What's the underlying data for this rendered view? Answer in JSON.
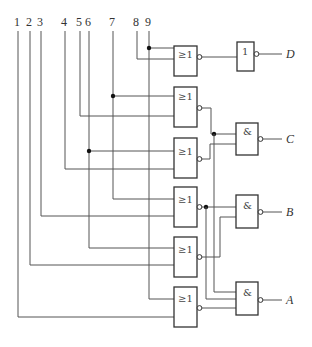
{
  "diagram": {
    "type": "logic-circuit",
    "inputs": [
      "1",
      "2",
      "3",
      "4",
      "5",
      "6",
      "7",
      "8",
      "9"
    ],
    "gates": {
      "nor1": {
        "symbol": "≥1",
        "inputs": [
          "9",
          "8"
        ]
      },
      "nor2": {
        "symbol": "≥1",
        "inputs": [
          "7",
          "5"
        ]
      },
      "nor3": {
        "symbol": "≥1",
        "inputs": [
          "6",
          "4"
        ]
      },
      "nor4": {
        "symbol": "≥1",
        "inputs": [
          "7",
          "3"
        ]
      },
      "nor5": {
        "symbol": "≥1",
        "inputs": [
          "6",
          "2"
        ]
      },
      "nor6": {
        "symbol": "≥1",
        "inputs": [
          "9",
          "1"
        ]
      },
      "not_d": {
        "symbol": "1",
        "inputs": [
          "nor1"
        ]
      },
      "nand_c": {
        "symbol": "&",
        "inputs": [
          "nor2",
          "nor3"
        ]
      },
      "nand_b": {
        "symbol": "&",
        "inputs": [
          "nor4",
          "nor5"
        ]
      },
      "nand_a": {
        "symbol": "&",
        "inputs": [
          "nor2",
          "nor4",
          "nor6"
        ]
      }
    },
    "outputs": [
      "D",
      "C",
      "B",
      "A"
    ]
  }
}
